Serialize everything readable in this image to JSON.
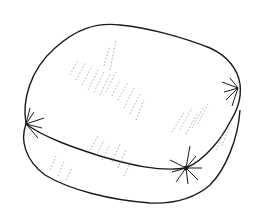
{
  "image": {
    "subject": "cushion-line-drawing",
    "style": "black ink sketch on white",
    "colors": {
      "background": "#ffffff",
      "ink": "#1a1a1a",
      "hatch": "#8a8a8a"
    }
  }
}
